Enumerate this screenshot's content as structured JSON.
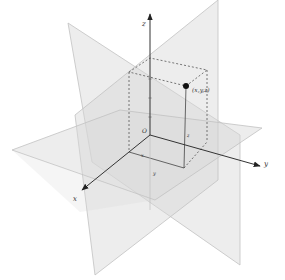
{
  "diagram": {
    "axes": {
      "x": {
        "label": "x"
      },
      "y": {
        "label": "y"
      },
      "z": {
        "label": "z"
      }
    },
    "origin_label": "O",
    "point_label": "(x,y,z)",
    "box_labels": {
      "x_front": "x",
      "x_base": "y",
      "z_vertical": "z"
    },
    "colors": {
      "plane_fill": "#d8d8d8",
      "plane_edge": "#c4c4c4",
      "axis": "#333333",
      "point": "#111111",
      "dashed": "#555555"
    }
  }
}
